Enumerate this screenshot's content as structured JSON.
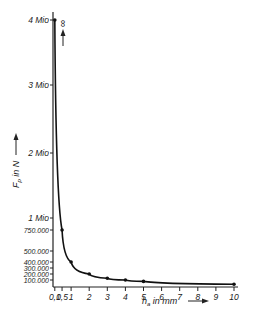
{
  "chart_data": {
    "type": "line",
    "title": "",
    "xlabel": "h_a in mm",
    "ylabel": "F_P in N",
    "x": [
      0.1,
      0.5,
      1,
      2,
      3,
      4,
      5,
      10
    ],
    "series": [
      {
        "name": "F_P",
        "values": [
          4000000,
          750000,
          400000,
          200000,
          130000,
          100000,
          80000,
          40000
        ]
      }
    ],
    "x_ticks": [
      "0,1",
      "0,5",
      "1",
      "2",
      "3",
      "4",
      "5",
      "6",
      "7",
      "8",
      "9",
      "10"
    ],
    "x_tick_values": [
      0.1,
      0.5,
      1,
      2,
      3,
      4,
      5,
      6,
      7,
      8,
      9,
      10
    ],
    "y_ticks_major": [
      "1 Mio",
      "2 Mio",
      "3 Mio",
      "4 Mio"
    ],
    "y_ticks_minor": [
      "100.000",
      "200.000",
      "300.000",
      "400.000",
      "500.000",
      "750.000"
    ],
    "annotation": "∞",
    "xlim": [
      0,
      10
    ],
    "ylim": [
      0,
      4000000
    ],
    "grid": false,
    "legend": "none"
  },
  "labels": {
    "infinity": "∞",
    "xlabel_main": "h",
    "xlabel_sub": "a",
    "xlabel_rest": " in mm",
    "ylabel_main": "F",
    "ylabel_sub": "p",
    "ylabel_rest": " in N"
  }
}
